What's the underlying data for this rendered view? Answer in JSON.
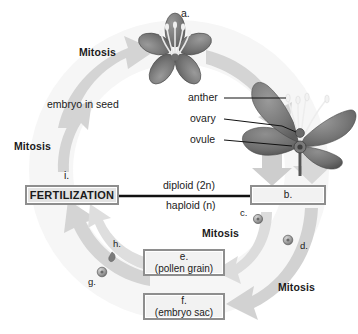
{
  "diagram": {
    "accent_color": "#c9c9c9",
    "line_color": "#1b1b1b",
    "box_border_color": "#8e8e8e"
  },
  "labels": {
    "a": "a.",
    "i": "i.",
    "c": "c.",
    "d": "d.",
    "g": "g.",
    "h": "h."
  },
  "cycle_labels": {
    "mitosis_top_left": "Mitosis",
    "mitosis_mid_left": "Mitosis",
    "mitosis_mid_right": "Mitosis",
    "mitosis_bottom_right": "Mitosis",
    "embryo_in_seed": "embryo in seed"
  },
  "ploidy": {
    "diploid": "diploid (2n)",
    "haploid": "haploid (n)"
  },
  "flower_parts": {
    "anther": "anther",
    "ovary": "ovary",
    "ovule": "ovule"
  },
  "boxes": {
    "fertilization": {
      "line1": "FERTILIZATION"
    },
    "b": {
      "line1": "b."
    },
    "e": {
      "line1": "e.",
      "line2": "(pollen grain)"
    },
    "f": {
      "line1": "f.",
      "line2": "(embryo sac)"
    }
  },
  "icons": {
    "flower_top": "flower-top-view-icon",
    "flower_side": "flower-side-view-icon",
    "spore_c": "spore-icon",
    "spore_d": "spore-icon",
    "spore_g": "spore-icon",
    "spore_h": "sperm-cell-icon"
  }
}
